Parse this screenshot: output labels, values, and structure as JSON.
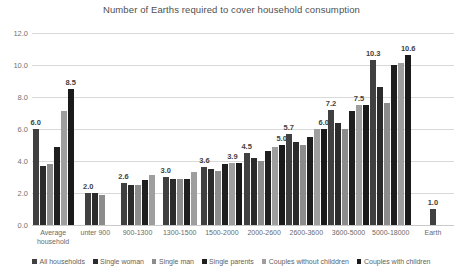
{
  "chart_data": {
    "type": "bar",
    "title": "Number of Earths required to cover household consumption",
    "xlabel": "",
    "ylabel": "",
    "ylim": [
      0.0,
      12.0
    ],
    "yticks": [
      "0.0",
      "2.0",
      "4.0",
      "6.0",
      "8.0",
      "10.0",
      "12.0"
    ],
    "ytick_values": [
      0,
      2,
      4,
      6,
      8,
      10,
      12
    ],
    "grid": true,
    "legend_position": "bottom",
    "categories": [
      "Average household",
      "unter 900",
      "900-1300",
      "1300-1500",
      "1500-2000",
      "2000-2600",
      "2600-3600",
      "3600-5000",
      "5000-18000",
      "Earth"
    ],
    "category_lines": [
      [
        "Average",
        "household"
      ],
      [
        "unter 900"
      ],
      [
        "900-1300"
      ],
      [
        "1300-1500"
      ],
      [
        "1500-2000"
      ],
      [
        "2000-2600"
      ],
      [
        "2600-3600"
      ],
      [
        "3600-5000"
      ],
      [
        "5000-18000"
      ],
      [
        "Earth"
      ]
    ],
    "series": [
      {
        "name": "All households",
        "color": "#404040",
        "values": [
          6.0,
          2.0,
          2.6,
          3.0,
          3.6,
          4.5,
          5.7,
          7.2,
          10.3,
          1.0
        ]
      },
      {
        "name": "Single woman",
        "color": "#2b2b2b",
        "values": [
          3.7,
          2.0,
          2.5,
          2.9,
          3.5,
          4.2,
          5.2,
          6.4,
          8.6,
          null
        ]
      },
      {
        "name": "Single man",
        "color": "#8c8c8c",
        "values": [
          3.8,
          1.9,
          2.5,
          2.9,
          3.4,
          4.0,
          5.0,
          6.0,
          7.6,
          null
        ]
      },
      {
        "name": "Single parents",
        "color": "#1f1f1f",
        "values": [
          4.9,
          null,
          2.8,
          2.9,
          3.8,
          4.6,
          5.5,
          7.1,
          10.0,
          null
        ]
      },
      {
        "name": "Couples without childdren",
        "color": "#9e9e9e",
        "values": [
          7.1,
          null,
          3.1,
          3.3,
          3.9,
          4.9,
          6.0,
          7.5,
          10.1,
          null
        ]
      },
      {
        "name": "Couples with children",
        "color": "#1a1a1a",
        "values": [
          8.5,
          null,
          null,
          null,
          3.9,
          5.0,
          6.0,
          7.5,
          10.6,
          null
        ]
      }
    ],
    "data_labels": {
      "Average household": "6.0",
      "Average household peak": "8.5",
      "unter 900": "2.0",
      "900-1300": "2.6",
      "1300-1500": "3.0",
      "1500-2000": "3.6",
      "1500-2000 peak": "3.9",
      "2000-2600": "4.5",
      "2000-2600 peak": "5.0",
      "2600-3600": "5.7",
      "2600-3600 peak": "6.0",
      "3600-5000": "7.2",
      "3600-5000 peak": "7.5",
      "5000-18000": "10.3",
      "5000-18000 peak": "10.6",
      "Earth": "1.0"
    },
    "visible_labels": [
      {
        "group": 0,
        "bar": 0,
        "text": "6.0"
      },
      {
        "group": 0,
        "bar": 5,
        "text": "8.5"
      },
      {
        "group": 1,
        "bar": 0,
        "text": "2.0"
      },
      {
        "group": 2,
        "bar": 0,
        "text": "2.6"
      },
      {
        "group": 3,
        "bar": 0,
        "text": "3.0"
      },
      {
        "group": 4,
        "bar": 0,
        "text": "3.6"
      },
      {
        "group": 4,
        "bar": 4,
        "text": "3.9"
      },
      {
        "group": 5,
        "bar": 0,
        "text": "4.5"
      },
      {
        "group": 5,
        "bar": 5,
        "text": "5.0"
      },
      {
        "group": 6,
        "bar": 0,
        "text": "5.7"
      },
      {
        "group": 6,
        "bar": 5,
        "text": "6.0"
      },
      {
        "group": 7,
        "bar": 0,
        "text": "7.2"
      },
      {
        "group": 7,
        "bar": 4,
        "text": "7.5"
      },
      {
        "group": 8,
        "bar": 0,
        "text": "10.3"
      },
      {
        "group": 8,
        "bar": 5,
        "text": "10.6"
      },
      {
        "group": 9,
        "bar": 0,
        "text": "1.0"
      }
    ]
  },
  "legend": {
    "items": [
      {
        "label": "All households",
        "color": "#404040"
      },
      {
        "label": "Single woman",
        "color": "#2b2b2b"
      },
      {
        "label": "Single man",
        "color": "#8c8c8c"
      },
      {
        "label": "Single parents",
        "color": "#1f1f1f"
      },
      {
        "label": "Couples without childdren",
        "color": "#9e9e9e"
      },
      {
        "label": "Couples with children",
        "color": "#1a1a1a"
      }
    ]
  }
}
